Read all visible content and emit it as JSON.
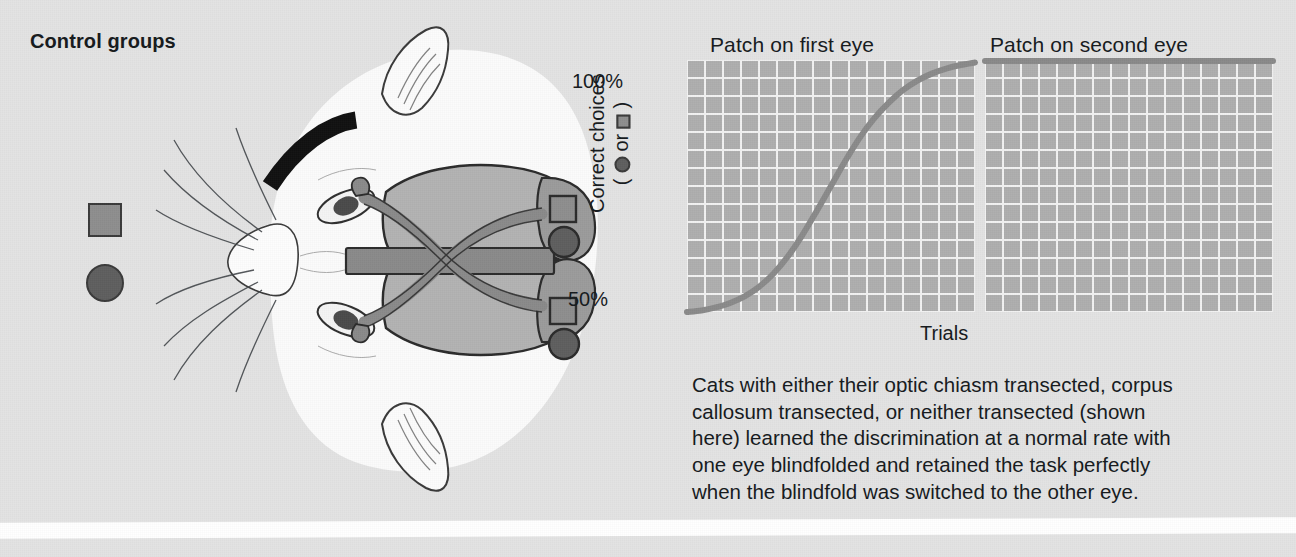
{
  "figure": {
    "section_title": "Control groups",
    "background_color": "#e3e3e3"
  },
  "legend": {
    "square_label": "square-symbol",
    "circle_label": "circle-symbol",
    "square_color": "#8e8e8e",
    "circle_color": "#5e5e5e",
    "outline_color": "#3a3a3a"
  },
  "illustration": {
    "name": "cat-head-brain-diagram",
    "eye_patch_color": "#101010",
    "brain_fill": "#b2b2b2",
    "pathway_fill": "#8a8a8a",
    "callosum_fill": "#8a8a8a",
    "outline_color": "#2a2a2a",
    "description": "Top view of a cat head with a black patch over the first eye, showing the optic nerves crossing at the optic chiasm, the corpus callosum, and visual cortex areas marked with a square and a circle"
  },
  "graphs": {
    "y_label_prefix": "Correct choices",
    "y_label_paren_open": "(",
    "y_label_or": "or",
    "y_label_paren_close": ")",
    "x_label": "Trials",
    "tick_top": "100%",
    "tick_bottom": "50%",
    "grid_color": "#aeaeae",
    "gridline_color": "#f2f2f2",
    "curve_color": "#8a8a8a"
  },
  "chart_data": [
    {
      "type": "line",
      "title": "Patch on first eye",
      "xlabel": "Trials",
      "ylabel": "Correct choices ( ● or ■ )",
      "ylim": [
        50,
        100
      ],
      "ytick_labels": [
        "50%",
        "100%"
      ],
      "grid": true,
      "legend": "none",
      "x": [
        0,
        5,
        10,
        15,
        20,
        25,
        30,
        35,
        40,
        45,
        50,
        55,
        60,
        65,
        70,
        75,
        80,
        85,
        90,
        95,
        100
      ],
      "values": [
        50.0,
        50.3,
        50.9,
        51.8,
        53.1,
        55.0,
        57.6,
        61.0,
        65.2,
        70.0,
        75.0,
        80.0,
        84.6,
        88.4,
        91.5,
        94.0,
        95.9,
        97.3,
        98.3,
        99.0,
        99.5
      ],
      "annotation": "Learning curve rises sigmoidally from chance (50%) to near-perfect (100%)"
    },
    {
      "type": "line",
      "title": "Patch on second eye",
      "xlabel": "Trials",
      "ylabel": "Correct choices ( ● or ■ )",
      "ylim": [
        50,
        100
      ],
      "ytick_labels": [
        "50%",
        "100%"
      ],
      "grid": true,
      "legend": "none",
      "x": [
        0,
        10,
        20,
        30,
        40,
        50,
        60,
        70,
        80,
        90,
        100
      ],
      "values": [
        99.8,
        99.8,
        99.8,
        99.8,
        99.8,
        99.8,
        99.8,
        99.8,
        99.8,
        99.8,
        99.8
      ],
      "annotation": "Performance stays flat at 100% — the task is retained perfectly with the other eye"
    }
  ],
  "caption": {
    "lines": [
      "Cats with either their optic chiasm transected, corpus",
      "callosum transected, or neither transected (shown",
      "here) learned the discrimination at a normal rate with",
      "one eye blindfolded and retained the task perfectly",
      "when the blindfold was switched to the other eye."
    ]
  }
}
